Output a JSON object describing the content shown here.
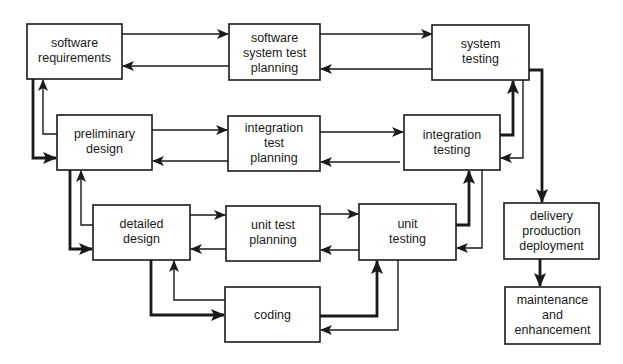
{
  "diagram": {
    "colors": {
      "line": "#1a1a1a",
      "background": "#ffffff"
    },
    "boxes": {
      "software_requirements": {
        "lines": [
          "software",
          "requirements"
        ]
      },
      "software_system_test_planning": {
        "lines": [
          "software",
          "system test",
          "planning"
        ]
      },
      "system_testing": {
        "lines": [
          "system",
          "testing"
        ]
      },
      "preliminary_design": {
        "lines": [
          "preliminary",
          "design"
        ]
      },
      "integration_test_planning": {
        "lines": [
          "integration",
          "test",
          "planning"
        ]
      },
      "integration_testing": {
        "lines": [
          "integration",
          "testing"
        ]
      },
      "detailed_design": {
        "lines": [
          "detailed",
          "design"
        ]
      },
      "unit_test_planning": {
        "lines": [
          "unit test",
          "planning"
        ]
      },
      "unit_testing": {
        "lines": [
          "unit",
          "testing"
        ]
      },
      "coding": {
        "lines": [
          "coding"
        ]
      },
      "delivery": {
        "lines": [
          "delivery",
          "production",
          "deployment"
        ]
      },
      "maintenance": {
        "lines": [
          "maintenance",
          "and",
          "enhancement"
        ]
      }
    },
    "edges": [
      {
        "from": "software requirements",
        "to": "software system test planning"
      },
      {
        "from": "software system test planning",
        "to": "software requirements"
      },
      {
        "from": "software system test planning",
        "to": "system testing"
      },
      {
        "from": "system testing",
        "to": "software system test planning"
      },
      {
        "from": "preliminary design",
        "to": "integration test planning"
      },
      {
        "from": "integration test planning",
        "to": "preliminary design"
      },
      {
        "from": "integration test planning",
        "to": "integration testing"
      },
      {
        "from": "integration testing",
        "to": "integration test planning"
      },
      {
        "from": "detailed design",
        "to": "unit test planning"
      },
      {
        "from": "unit test planning",
        "to": "detailed design"
      },
      {
        "from": "unit test planning",
        "to": "unit testing"
      },
      {
        "from": "unit testing",
        "to": "unit test planning"
      },
      {
        "from": "software requirements",
        "to": "preliminary design",
        "weight": "thick"
      },
      {
        "from": "preliminary design",
        "to": "software requirements"
      },
      {
        "from": "preliminary design",
        "to": "detailed design",
        "weight": "thick"
      },
      {
        "from": "detailed design",
        "to": "preliminary design"
      },
      {
        "from": "detailed design",
        "to": "coding",
        "weight": "thick"
      },
      {
        "from": "coding",
        "to": "detailed design"
      },
      {
        "from": "coding",
        "to": "unit testing",
        "weight": "thick"
      },
      {
        "from": "unit testing",
        "to": "coding"
      },
      {
        "from": "unit testing",
        "to": "integration testing",
        "weight": "thick"
      },
      {
        "from": "integration testing",
        "to": "unit testing"
      },
      {
        "from": "integration testing",
        "to": "system testing",
        "weight": "thick"
      },
      {
        "from": "system testing",
        "to": "integration testing"
      },
      {
        "from": "system testing",
        "to": "delivery production deployment",
        "weight": "thick"
      },
      {
        "from": "delivery production deployment",
        "to": "maintenance and enhancement",
        "weight": "thick"
      }
    ]
  }
}
